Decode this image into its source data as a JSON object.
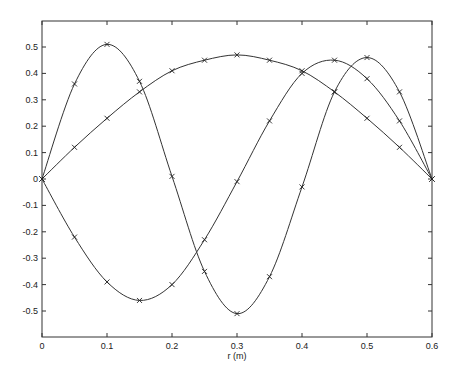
{
  "chart_data": {
    "type": "line",
    "title": "",
    "xlabel": "r (m)",
    "ylabel": "",
    "xlim": [
      0,
      0.6
    ],
    "ylim": [
      -0.58,
      0.59
    ],
    "xticks": [
      0,
      0.1,
      0.2,
      0.3,
      0.4,
      0.5,
      0.6
    ],
    "xtick_labels": [
      "0",
      "0.1",
      "0.2",
      "0.3",
      "0.4",
      "0.5",
      "0.6"
    ],
    "yticks": [
      -0.5,
      -0.4,
      -0.3,
      -0.2,
      -0.1,
      0,
      0.1,
      0.2,
      0.3,
      0.4,
      0.5
    ],
    "ytick_labels": [
      "-0.5",
      "-0.4",
      "-0.3",
      "-0.2",
      "-0.1",
      "0",
      "0.1",
      "0.2",
      "0.3",
      "0.4",
      "0.5"
    ],
    "grid": false,
    "marker": "x",
    "x": [
      0,
      0.05,
      0.1,
      0.15,
      0.2,
      0.25,
      0.3,
      0.35,
      0.4,
      0.45,
      0.5,
      0.55,
      0.6
    ],
    "series": [
      {
        "name": "mode 1",
        "values": [
          0,
          0.12,
          0.23,
          0.33,
          0.41,
          0.45,
          0.47,
          0.45,
          0.41,
          0.33,
          0.23,
          0.12,
          0
        ]
      },
      {
        "name": "mode 2",
        "values": [
          0,
          0.36,
          0.51,
          0.37,
          0.01,
          -0.35,
          -0.51,
          -0.37,
          -0.03,
          0.33,
          0.46,
          0.33,
          0
        ]
      },
      {
        "name": "mode 3",
        "values": [
          0,
          -0.22,
          -0.39,
          -0.46,
          -0.4,
          -0.23,
          -0.01,
          0.22,
          0.4,
          0.45,
          0.38,
          0.22,
          0
        ]
      }
    ]
  }
}
